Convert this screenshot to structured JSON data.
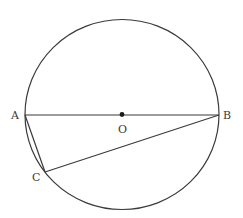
{
  "diagram": {
    "type": "geometry",
    "circle": {
      "center": "O",
      "cx": 122,
      "cy": 114.5,
      "rx": 97,
      "ry": 95
    },
    "points": {
      "A": {
        "x": 25,
        "y": 115,
        "label": "A"
      },
      "B": {
        "x": 219,
        "y": 115,
        "label": "B"
      },
      "O": {
        "x": 122,
        "y": 114.5,
        "label": "O"
      },
      "C": {
        "x": 45,
        "y": 172,
        "label": "C"
      }
    },
    "segments": [
      {
        "from": "A",
        "to": "B",
        "name": "diameter-AB"
      },
      {
        "from": "A",
        "to": "C",
        "name": "chord-AC"
      },
      {
        "from": "B",
        "to": "C",
        "name": "chord-BC"
      }
    ],
    "colors": {
      "stroke": "#3a3a3a",
      "background": "#ffffff"
    }
  }
}
